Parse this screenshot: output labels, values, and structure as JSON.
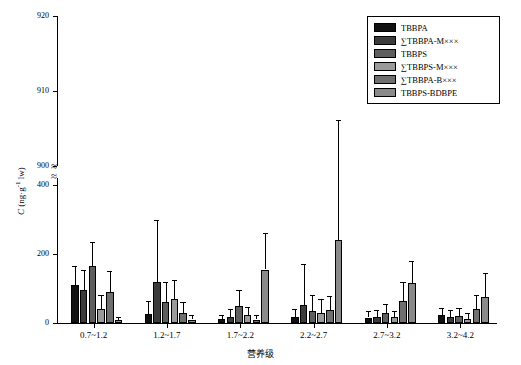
{
  "chart_data": {
    "type": "bar",
    "title": "",
    "xlabel": "营养级",
    "ylabel": "C (ng·g-1 lw)",
    "ylabel_plain": "C (ng·g⁻¹ lw)",
    "categories": [
      "0.7~1.2",
      "1.2~1.7",
      "1.7~2.2",
      "2.2~2.7",
      "2.7~3.2",
      "3.2~4.2"
    ],
    "axis_break": true,
    "lower_ticks": [
      0,
      200,
      400
    ],
    "upper_ticks": [
      900,
      910,
      920
    ],
    "ylim_lower": [
      0,
      430
    ],
    "ylim_upper": [
      895,
      920
    ],
    "grid": false,
    "legend_position": "top-right",
    "series": [
      {
        "name": "TBBPA",
        "color": "#111111",
        "values": [
          110,
          25,
          12,
          18,
          16,
          22
        ],
        "errors": [
          55,
          40,
          12,
          22,
          18,
          22
        ]
      },
      {
        "name": "∑TBBPA-M×××",
        "color": "#3b3b3b",
        "values": [
          95,
          120,
          18,
          52,
          18,
          18
        ],
        "errors": [
          60,
          180,
          22,
          120,
          20,
          20
        ]
      },
      {
        "name": "TBBPS",
        "color": "#5e5e5e",
        "values": [
          165,
          60,
          50,
          35,
          30,
          20
        ],
        "errors": [
          70,
          60,
          45,
          45,
          25,
          25
        ]
      },
      {
        "name": "∑TBBPS-M×××",
        "color": "#9a9a9a",
        "values": [
          40,
          70,
          22,
          30,
          18,
          12
        ],
        "errors": [
          40,
          55,
          25,
          40,
          18,
          18
        ]
      },
      {
        "name": "∑TBBPA-B×××",
        "color": "#6f6f6f",
        "values": [
          90,
          30,
          10,
          38,
          65,
          40
        ],
        "errors": [
          60,
          30,
          12,
          40,
          55,
          40
        ]
      },
      {
        "name": "TBBPS-BDBPE",
        "color": "#8a8a8a",
        "values": [
          8,
          10,
          155,
          240,
          115,
          75
        ],
        "errors": [
          10,
          12,
          105,
          680,
          65,
          70
        ]
      }
    ]
  },
  "legend": {
    "items": [
      {
        "label": "TBBPA",
        "color": "#111111"
      },
      {
        "label": "∑TBBPA-M×××",
        "color": "#3b3b3b"
      },
      {
        "label": "TBBPS",
        "color": "#5e5e5e"
      },
      {
        "label": "∑TBBPS-M×××",
        "color": "#9a9a9a"
      },
      {
        "label": "∑TBBPA-B×××",
        "color": "#6f6f6f"
      },
      {
        "label": "TBBPS-BDBPE",
        "color": "#8a8a8a"
      }
    ]
  },
  "axes": {
    "y_title_prefix": "C",
    "y_title_rest": " (ng·g",
    "y_title_sup": "-1",
    "y_title_suffix": " lw)",
    "x_title": "营养级",
    "y_ticks_upper": [
      "920",
      "910",
      "900"
    ],
    "y_ticks_lower": [
      "400",
      "200",
      "0"
    ],
    "x_ticks": [
      "0.7~1.2",
      "1.2~1.7",
      "1.7~2.2",
      "2.2~2.7",
      "2.7~3.2",
      "3.2~4.2"
    ]
  }
}
